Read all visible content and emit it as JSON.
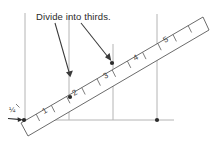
{
  "figure": {
    "title": "Divide into thirds",
    "width": 222,
    "height": 143,
    "background_color": "#ffffff"
  },
  "annotation": {
    "label": "Divide into thirds.",
    "x": 36,
    "y": 17,
    "arrows": [
      {
        "name": "arrow-to-left-mark",
        "x1": 55,
        "y1": 21,
        "x2": 70,
        "y2": 76
      },
      {
        "name": "arrow-to-right-mark",
        "x1": 81,
        "y1": 21,
        "x2": 111,
        "y2": 61
      }
    ]
  },
  "origin_label": {
    "text": "¼",
    "x": 9,
    "y": 110
  },
  "ruler": {
    "color": "#4a4a4a",
    "angle_degrees": -28,
    "numbers": [
      "1",
      "2",
      "3",
      "4",
      "5"
    ],
    "tick_count": 11,
    "corners": [
      {
        "x": 21,
        "y": 123
      },
      {
        "x": 203,
        "y": 17
      },
      {
        "x": 209,
        "y": 30
      },
      {
        "x": 28,
        "y": 136
      }
    ]
  },
  "construction_lines": {
    "color": "#b0b0b0",
    "vertical": [
      {
        "name": "vertical-line-left",
        "x": 25,
        "y1": 13,
        "y2": 120
      },
      {
        "name": "vertical-line-second",
        "x": 69,
        "y1": 16,
        "y2": 120
      },
      {
        "name": "vertical-line-third",
        "x": 113,
        "y1": 44,
        "y2": 120
      },
      {
        "name": "vertical-line-right",
        "x": 157,
        "y1": 14,
        "y2": 120
      }
    ],
    "horizontal": [
      {
        "name": "baseline",
        "x1": 22,
        "y1": 120,
        "x2": 172,
        "y2": 120
      }
    ]
  },
  "points": [
    {
      "name": "point-origin",
      "x": 24,
      "y": 120
    },
    {
      "name": "point-first-third",
      "x": 70,
      "y": 97
    },
    {
      "name": "point-second-third",
      "x": 112,
      "y": 63
    },
    {
      "name": "point-baseline-right",
      "x": 157,
      "y": 120
    }
  ],
  "colors": {
    "ink": "#3a3a3a",
    "construction": "#b0b0b0",
    "text": "#2b2b2b"
  }
}
